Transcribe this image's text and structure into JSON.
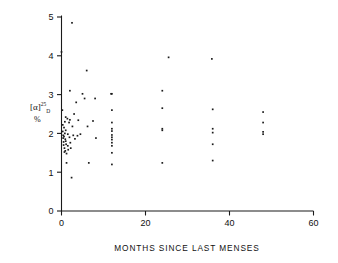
{
  "chart_data": {
    "type": "scatter",
    "title": "",
    "xlabel": "MONTHS SINCE LAST MENSES",
    "ylabel": "[a]25D",
    "ylabel_base": "[α]",
    "ylabel_sup": "25",
    "ylabel_sub": "D",
    "ylabel_units": "%",
    "xlim": [
      0,
      60
    ],
    "ylim": [
      0,
      5
    ],
    "xticks": [
      0,
      20,
      40,
      60
    ],
    "yticks": [
      0,
      1,
      2,
      3,
      4,
      5
    ],
    "xtick_labels": [
      "0",
      "20",
      "40",
      "60"
    ],
    "ytick_labels": [
      "0",
      "1",
      "2",
      "3",
      "4",
      "5"
    ],
    "grid": false,
    "legend": null,
    "marker": "dot",
    "marker_color": "#1b1b1b",
    "points": [
      [
        0.0,
        4.1
      ],
      [
        0.2,
        2.6
      ],
      [
        0.3,
        2.22
      ],
      [
        0.3,
        2.05
      ],
      [
        0.4,
        1.95
      ],
      [
        0.4,
        1.88
      ],
      [
        0.5,
        1.78
      ],
      [
        0.5,
        1.7
      ],
      [
        0.6,
        2.15
      ],
      [
        0.6,
        1.92
      ],
      [
        0.7,
        1.62
      ],
      [
        0.7,
        1.52
      ],
      [
        0.8,
        2.3
      ],
      [
        0.8,
        2.0
      ],
      [
        0.9,
        1.85
      ],
      [
        0.9,
        1.55
      ],
      [
        1.0,
        2.42
      ],
      [
        1.0,
        2.08
      ],
      [
        1.0,
        1.8
      ],
      [
        1.1,
        1.72
      ],
      [
        1.2,
        1.48
      ],
      [
        1.2,
        1.24
      ],
      [
        1.4,
        2.38
      ],
      [
        1.5,
        1.98
      ],
      [
        1.5,
        1.68
      ],
      [
        1.6,
        1.58
      ],
      [
        1.8,
        2.28
      ],
      [
        1.9,
        1.9
      ],
      [
        2.0,
        3.1
      ],
      [
        2.0,
        2.35
      ],
      [
        2.1,
        1.76
      ],
      [
        2.2,
        1.62
      ],
      [
        2.4,
        0.86
      ],
      [
        2.5,
        4.85
      ],
      [
        2.6,
        2.18
      ],
      [
        2.8,
        1.95
      ],
      [
        3.0,
        2.5
      ],
      [
        3.2,
        1.86
      ],
      [
        3.5,
        2.8
      ],
      [
        3.8,
        1.94
      ],
      [
        4.0,
        2.34
      ],
      [
        4.5,
        1.98
      ],
      [
        5.0,
        3.02
      ],
      [
        5.5,
        2.9
      ],
      [
        6.0,
        3.62
      ],
      [
        6.2,
        2.18
      ],
      [
        6.5,
        1.24
      ],
      [
        7.5,
        2.32
      ],
      [
        8.0,
        2.9
      ],
      [
        8.2,
        1.88
      ],
      [
        11.8,
        3.02
      ],
      [
        12.0,
        3.02
      ],
      [
        12.0,
        2.6
      ],
      [
        12.0,
        2.28
      ],
      [
        12.0,
        2.12
      ],
      [
        12.0,
        2.06
      ],
      [
        12.0,
        1.96
      ],
      [
        12.0,
        1.9
      ],
      [
        12.0,
        1.84
      ],
      [
        12.0,
        1.76
      ],
      [
        12.0,
        1.68
      ],
      [
        12.0,
        1.5
      ],
      [
        12.0,
        1.2
      ],
      [
        24.0,
        3.1
      ],
      [
        24.0,
        2.65
      ],
      [
        24.0,
        2.12
      ],
      [
        24.0,
        2.08
      ],
      [
        24.0,
        1.24
      ],
      [
        25.5,
        3.96
      ],
      [
        35.8,
        3.92
      ],
      [
        36.0,
        2.62
      ],
      [
        36.0,
        2.12
      ],
      [
        36.0,
        2.02
      ],
      [
        36.0,
        1.72
      ],
      [
        36.0,
        1.3
      ],
      [
        48.0,
        2.55
      ],
      [
        48.0,
        2.28
      ],
      [
        48.0,
        2.04
      ],
      [
        48.0,
        1.98
      ]
    ]
  },
  "axes": {
    "x_title": "MONTHS SINCE LAST MENSES"
  }
}
